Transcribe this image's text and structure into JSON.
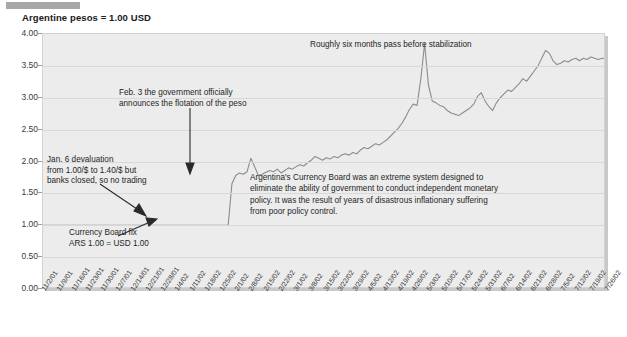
{
  "title": "Argentine pesos = 1.00 USD",
  "annotations": {
    "top": "Roughly six months pass before stabilization",
    "feb3": "Feb. 3 the government officially\nannounces the flotation of the peso",
    "jan6": "Jan. 6 devaluation\nfrom 1.00/$ to 1.40/$ but\nbanks closed, so no trading",
    "currency_board_fix": "Currency Board fix\nARS 1.00 = USD 1.00",
    "paragraph": "Argentina's Currency Board was an extreme system designed to\neliminate the ability of government to conduct independent monetary\npolicy. It was the result of years of disastrous inflationary suffering\nfrom poor policy control."
  },
  "chart_data": {
    "type": "line",
    "title": "Argentine pesos = 1.00 USD",
    "xlabel": "",
    "ylabel": "",
    "ylim": [
      0.0,
      4.0
    ],
    "ytick_step": 0.5,
    "grid": true,
    "legend": "none",
    "line_color": "#8c8c8c",
    "plot_background": "#ececec",
    "yticks": [
      "0.00",
      "0.50",
      "1.00",
      "1.50",
      "2.00",
      "2.50",
      "3.00",
      "3.50",
      "4.00"
    ],
    "categories": [
      "11/2/01",
      "11/9/01",
      "11/16/01",
      "11/23/01",
      "11/30/01",
      "12/7/01",
      "12/14/01",
      "12/21/01",
      "12/28/01",
      "1/4/02",
      "1/11/02",
      "1/18/02",
      "1/25/02",
      "2/1/02",
      "2/8/02",
      "2/15/02",
      "2/22/02",
      "3/1/02",
      "3/8/02",
      "3/15/02",
      "3/22/02",
      "3/29/02",
      "4/5/02",
      "4/12/02",
      "4/19/02",
      "4/26/02",
      "5/3/02",
      "5/10/02",
      "5/17/02",
      "5/24/02",
      "5/31/02",
      "6/7/02",
      "6/14/02",
      "6/21/02",
      "6/28/02",
      "7/5/02",
      "7/12/02",
      "7/19/02",
      "7/26/02"
    ],
    "values": [
      1.0,
      1.0,
      1.0,
      1.0,
      1.0,
      1.0,
      1.0,
      1.0,
      1.0,
      1.0,
      1.0,
      1.8,
      2.05,
      1.85,
      1.9,
      1.95,
      2.1,
      2.05,
      2.15,
      2.2,
      2.25,
      2.3,
      2.45,
      2.6,
      2.85,
      3.85,
      2.95,
      2.85,
      2.75,
      2.8,
      3.05,
      2.8,
      3.1,
      3.25,
      3.45,
      3.75,
      3.55,
      3.6,
      3.62
    ],
    "series_daily": [
      1.0,
      1.0,
      1.0,
      1.0,
      1.0,
      1.0,
      1.0,
      1.0,
      1.0,
      1.0,
      1.0,
      1.0,
      1.0,
      1.0,
      1.0,
      1.0,
      1.0,
      1.0,
      1.0,
      1.0,
      1.0,
      1.0,
      1.0,
      1.0,
      1.0,
      1.0,
      1.0,
      1.0,
      1.0,
      1.0,
      1.0,
      1.0,
      1.0,
      1.0,
      1.0,
      1.0,
      1.0,
      1.0,
      1.0,
      1.0,
      1.0,
      1.0,
      1.0,
      1.0,
      1.0,
      1.0,
      1.0,
      1.0,
      1.0,
      1.0,
      1.65,
      1.78,
      1.82,
      1.8,
      1.84,
      2.05,
      1.92,
      1.78,
      1.8,
      1.83,
      1.86,
      1.84,
      1.88,
      1.82,
      1.86,
      1.9,
      1.88,
      1.92,
      1.95,
      1.93,
      1.98,
      2.02,
      2.08,
      2.05,
      2.02,
      2.06,
      2.04,
      2.08,
      2.06,
      2.1,
      2.12,
      2.1,
      2.14,
      2.12,
      2.18,
      2.22,
      2.2,
      2.24,
      2.28,
      2.26,
      2.3,
      2.34,
      2.4,
      2.46,
      2.52,
      2.6,
      2.7,
      2.82,
      2.9,
      2.88,
      3.3,
      3.85,
      3.2,
      2.95,
      2.92,
      2.88,
      2.86,
      2.8,
      2.76,
      2.74,
      2.72,
      2.76,
      2.8,
      2.84,
      2.9,
      3.02,
      3.08,
      2.95,
      2.86,
      2.8,
      2.92,
      3.0,
      3.06,
      3.12,
      3.1,
      3.16,
      3.22,
      3.3,
      3.26,
      3.34,
      3.42,
      3.5,
      3.62,
      3.74,
      3.7,
      3.58,
      3.52,
      3.54,
      3.58,
      3.56,
      3.6,
      3.62,
      3.58,
      3.62,
      3.6,
      3.64,
      3.62,
      3.6,
      3.62,
      3.62
    ],
    "key_events": [
      {
        "label": "Currency Board fix ARS 1.00 = USD 1.00",
        "value": 1.0
      },
      {
        "label": "Jan. 6 devaluation from 1.00/$ to 1.40/$",
        "value": 1.4
      },
      {
        "label": "Feb. 3 flotation of the peso",
        "value": 1.8
      },
      {
        "label": "Peak spike",
        "value": 3.85
      },
      {
        "label": "Stabilization level",
        "value": 3.62
      }
    ]
  }
}
